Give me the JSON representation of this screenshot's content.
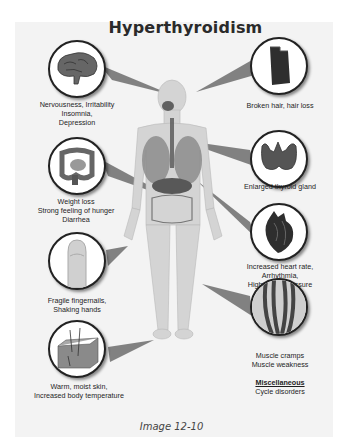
{
  "title": "Hyperthyroidism",
  "caption": "Image 12-10",
  "colors": {
    "panel_background": "#f3f3f3",
    "pointer_fill": "#6e6e6e",
    "circle_border": "#222222",
    "text": "#1e1e1e"
  },
  "symptoms": [
    {
      "icon": "brain-icon",
      "lines": [
        "Nervousness, Irritability",
        "Insomnia,",
        "Depression"
      ]
    },
    {
      "icon": "hair-icon",
      "lines": [
        "Broken hair, hair loss"
      ]
    },
    {
      "icon": "thyroid-icon",
      "lines": [
        "Enlarged thyroid gland"
      ]
    },
    {
      "icon": "intestine-icon",
      "lines": [
        "Weight loss",
        "Strong feeling of hunger",
        "Diarrhea"
      ]
    },
    {
      "icon": "heart-icon",
      "lines": [
        "Increased heart rate,",
        "Arrhythmia,",
        "High blood pressure"
      ]
    },
    {
      "icon": "finger-icon",
      "lines": [
        "Fragile fingernails,",
        "Shaking hands"
      ]
    },
    {
      "icon": "muscle-icon",
      "lines": [
        "Muscle cramps",
        "Muscle weakness"
      ]
    },
    {
      "icon": "skin-icon",
      "lines": [
        "Warm, moist skin,",
        "Increased body temperature"
      ]
    }
  ],
  "miscellaneous": {
    "heading": "Miscellaneous",
    "lines": [
      "Cycle disorders"
    ]
  }
}
